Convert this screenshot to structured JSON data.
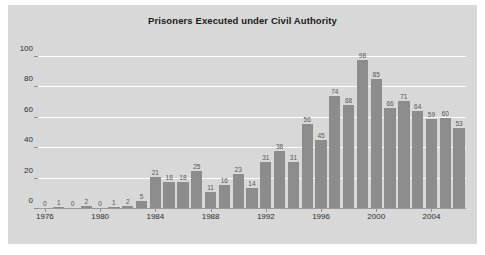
{
  "chart_data": {
    "type": "bar",
    "title": "Prisoners Executed under Civil Authority",
    "xlabel": "",
    "ylabel": "",
    "categories": [
      "1976",
      "1977",
      "1978",
      "1979",
      "1980",
      "1981",
      "1982",
      "1983",
      "1984",
      "1985",
      "1986",
      "1987",
      "1988",
      "1989",
      "1990",
      "1991",
      "1992",
      "1993",
      "1994",
      "1995",
      "1996",
      "1997",
      "1998",
      "1999",
      "2000",
      "2001",
      "2002",
      "2003",
      "2004",
      "2005",
      "2006"
    ],
    "values": [
      0,
      1,
      0,
      2,
      0,
      1,
      2,
      5,
      21,
      18,
      18,
      25,
      11,
      16,
      23,
      14,
      31,
      38,
      31,
      56,
      45,
      74,
      68,
      98,
      85,
      66,
      71,
      64,
      59,
      60,
      53
    ],
    "data_labels": [
      "0",
      "1",
      "0",
      "2",
      "0",
      "1",
      "2",
      "5",
      "21",
      "18",
      "18",
      "25",
      "11",
      "16",
      "23",
      "14",
      "31",
      "38",
      "31",
      "56",
      "45",
      "74",
      "68",
      "98",
      "85",
      "66",
      "71",
      "64",
      "59",
      "60",
      "53"
    ],
    "ylim": [
      0,
      105
    ],
    "yticks": [
      0,
      20,
      40,
      60,
      80,
      100
    ],
    "ytick_labels": [
      "0",
      "20",
      "40",
      "60",
      "80",
      "100"
    ],
    "xticks": [
      "1976",
      "1980",
      "1984",
      "1988",
      "1992",
      "1996",
      "2000",
      "2004"
    ],
    "xtick_indices": [
      0,
      4,
      8,
      12,
      16,
      20,
      24,
      28
    ],
    "grid": true,
    "grid_axis": "y",
    "legend": false,
    "bar_color": "#8c8c8c",
    "plot_background": "#d8d8d8",
    "grid_color": "#ffffff",
    "text_color": "#2b2b2b",
    "label_color": "#555555"
  }
}
